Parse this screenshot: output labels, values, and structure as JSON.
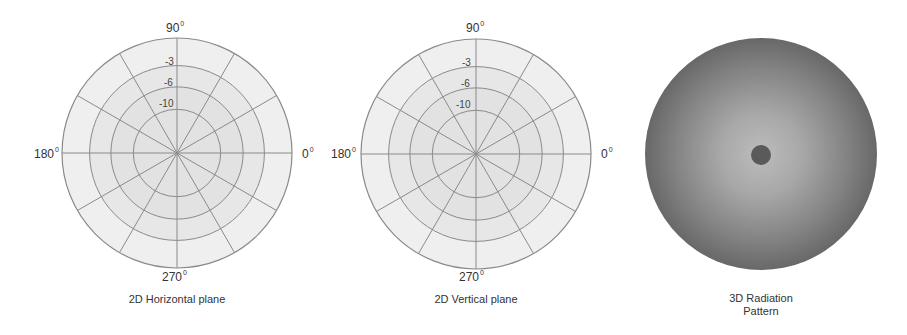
{
  "figure": {
    "panels": [
      {
        "id": "horizontal",
        "caption": "2D Horizontal plane",
        "center": [
          177,
          153
        ],
        "radius": 115,
        "angle_labels": {
          "top": "90",
          "left": "180",
          "right": "0",
          "bottom": "270",
          "degree_symbol": "0"
        },
        "ring_labels": [
          "-3",
          "-6",
          "-10"
        ]
      },
      {
        "id": "vertical",
        "caption": "2D Vertical plane",
        "center": [
          476,
          154
        ],
        "radius": 115,
        "angle_labels": {
          "top": "90",
          "left": "180",
          "right": "0",
          "bottom": "270",
          "degree_symbol": "0"
        },
        "ring_labels": [
          "-3",
          "-6",
          "-10"
        ]
      },
      {
        "id": "radiation3d",
        "caption_line1": "3D Radiation",
        "caption_line2": "Pattern",
        "center": [
          761,
          154
        ],
        "radius": 116
      }
    ],
    "colors": {
      "gridline": "#8a8a8a",
      "outer_band_fill": "#efefef",
      "ring3_fill": "#e7e7e7",
      "inner_fill": "#e2e2e2",
      "sphere_center": "#b8b8b8",
      "sphere_edge": "#6a6a6a",
      "sphere_dot": "#5a5a5a"
    }
  },
  "chart_data": {
    "type": "polar",
    "title": "",
    "panels": [
      {
        "name": "2D Horizontal plane",
        "radial_ticks_db": [
          -3,
          -6,
          -10
        ],
        "angular_ticks_deg": [
          0,
          90,
          180,
          270
        ],
        "spoke_interval_deg": 30,
        "grid": true
      },
      {
        "name": "2D Vertical plane",
        "radial_ticks_db": [
          -3,
          -6,
          -10
        ],
        "angular_ticks_deg": [
          0,
          90,
          180,
          270
        ],
        "spoke_interval_deg": 30,
        "grid": true
      },
      {
        "name": "3D Radiation Pattern",
        "kind": "shaded-sphere"
      }
    ]
  }
}
